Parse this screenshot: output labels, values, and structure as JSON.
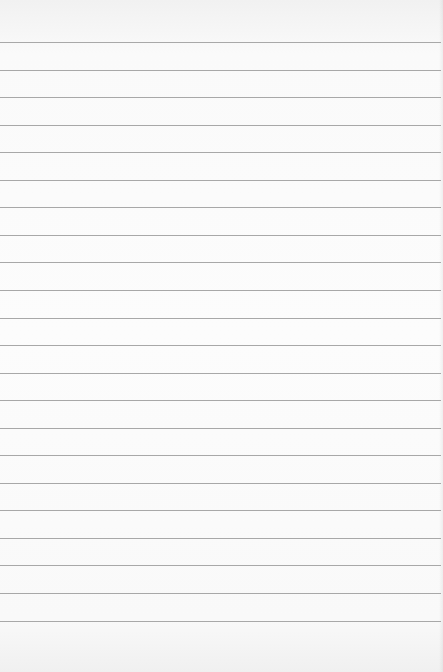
{
  "paper": {
    "type": "lined-notebook-paper",
    "background_color": "#fcfcfc",
    "rule_color": "#a8a8a8",
    "rule_count": 22,
    "first_rule_y": 42,
    "rule_spacing": 27.55
  }
}
